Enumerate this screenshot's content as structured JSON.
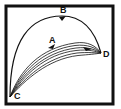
{
  "diagram": {
    "type": "curve-paths",
    "frame": {
      "x": 6,
      "y": 6,
      "width": 107,
      "height": 98,
      "stroke": "#111111"
    },
    "points": [
      {
        "id": "A",
        "label": "A",
        "x": 52,
        "y": 39
      },
      {
        "id": "B",
        "label": "B",
        "x": 63,
        "y": 12
      },
      {
        "id": "C",
        "label": "C",
        "x": 17,
        "y": 97
      },
      {
        "id": "D",
        "label": "D",
        "x": 106,
        "y": 56
      }
    ],
    "paths": [
      {
        "name": "upper-arc",
        "from": "C",
        "to": "D",
        "via": "B"
      },
      {
        "name": "lower-bundle",
        "from": "C",
        "to": "D",
        "via": "A",
        "line_count": 6
      }
    ],
    "colors": {
      "line": "#111111",
      "background": "#ffffff"
    }
  }
}
